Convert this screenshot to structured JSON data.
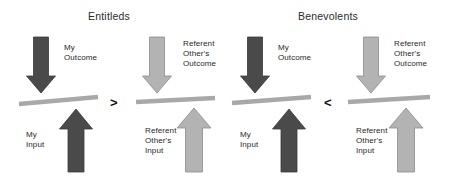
{
  "figure": {
    "type": "equity-theory-balance-diagram",
    "background": "#ffffff",
    "width": 451,
    "height": 179
  },
  "palette": {
    "dark_arrow": "#4a4a4a",
    "dark_arrow_stroke": "#3a3a3a",
    "light_arrow": "#b3b3b3",
    "light_arrow_stroke": "#8c8c8c",
    "beam": "#a8a8a8",
    "beam_stroke": "#9a9a9a",
    "text": "#1f1f1f",
    "title_text": "#2a2a2a"
  },
  "titles": [
    {
      "text": "Entitleds",
      "x": 88,
      "y": 10
    },
    {
      "text": "Benevolents",
      "x": 298,
      "y": 10
    }
  ],
  "comparators": [
    {
      "symbol": ">",
      "x": 110,
      "y": 96,
      "meaning": "my-ratio-greater-than-referent-ratio"
    },
    {
      "symbol": "<",
      "x": 324,
      "y": 96,
      "meaning": "my-ratio-less-than-referent-ratio"
    }
  ],
  "groups": [
    {
      "id": "entitleds-self",
      "title_ref": "Entitleds",
      "side": "self",
      "shade": "dark",
      "outcome_label": {
        "lines": [
          "My",
          "Outcome"
        ],
        "x": 64,
        "y": 43
      },
      "input_label": {
        "lines": [
          "My",
          "Input"
        ],
        "x": 26,
        "y": 130
      },
      "down_arrow": {
        "cx": 41,
        "top": 37,
        "bottom": 93,
        "shaft_w": 15,
        "head_w": 29,
        "head_h": 17
      },
      "up_arrow": {
        "cx": 76,
        "top": 109,
        "bottom": 172,
        "shaft_w": 16,
        "head_w": 33,
        "head_h": 20
      },
      "beam": {
        "x1": 19,
        "y1": 104,
        "x2": 98,
        "y2": 97,
        "thickness": 4.5
      }
    },
    {
      "id": "entitleds-referent",
      "title_ref": "Entitleds",
      "side": "referent",
      "shade": "light",
      "outcome_label": {
        "lines": [
          "Referent",
          "Other's",
          "Outcome"
        ],
        "x": 183,
        "y": 39
      },
      "input_label": {
        "lines": [
          "Referent",
          "Other's",
          "Input"
        ],
        "x": 145,
        "y": 126
      },
      "down_arrow": {
        "cx": 157,
        "top": 37,
        "bottom": 93,
        "shaft_w": 15,
        "head_w": 29,
        "head_h": 17
      },
      "up_arrow": {
        "cx": 194,
        "top": 108,
        "bottom": 172,
        "shaft_w": 17,
        "head_w": 34,
        "head_h": 20
      },
      "beam": {
        "x1": 136,
        "y1": 102,
        "x2": 215,
        "y2": 98,
        "thickness": 4.5
      }
    },
    {
      "id": "benevolents-self",
      "title_ref": "Benevolents",
      "side": "self",
      "shade": "dark",
      "outcome_label": {
        "lines": [
          "My",
          "Outcome"
        ],
        "x": 278,
        "y": 43
      },
      "input_label": {
        "lines": [
          "My",
          "Input"
        ],
        "x": 240,
        "y": 130
      },
      "down_arrow": {
        "cx": 255,
        "top": 37,
        "bottom": 93,
        "shaft_w": 15,
        "head_w": 29,
        "head_h": 17
      },
      "up_arrow": {
        "cx": 289,
        "top": 109,
        "bottom": 172,
        "shaft_w": 16,
        "head_w": 33,
        "head_h": 20
      },
      "beam": {
        "x1": 232,
        "y1": 103,
        "x2": 311,
        "y2": 97,
        "thickness": 4.5
      }
    },
    {
      "id": "benevolents-referent",
      "title_ref": "Benevolents",
      "side": "referent",
      "shade": "light",
      "outcome_label": {
        "lines": [
          "Referent",
          "Other's",
          "Outcome"
        ],
        "x": 394,
        "y": 39
      },
      "input_label": {
        "lines": [
          "Referent",
          "Other's",
          "Input"
        ],
        "x": 356,
        "y": 126
      },
      "down_arrow": {
        "cx": 371,
        "top": 37,
        "bottom": 93,
        "shaft_w": 15,
        "head_w": 29,
        "head_h": 17
      },
      "up_arrow": {
        "cx": 406,
        "top": 108,
        "bottom": 172,
        "shaft_w": 17,
        "head_w": 34,
        "head_h": 20
      },
      "beam": {
        "x1": 348,
        "y1": 102,
        "x2": 430,
        "y2": 97,
        "thickness": 4.5
      }
    }
  ]
}
